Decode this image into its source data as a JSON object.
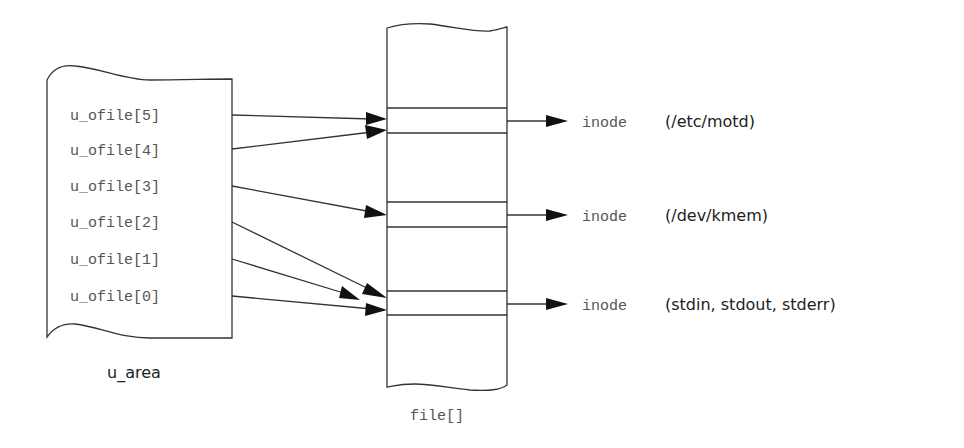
{
  "diagram": {
    "u_area": {
      "label": "u_area",
      "entries": [
        "u_ofile[5]",
        "u_ofile[4]",
        "u_ofile[3]",
        "u_ofile[2]",
        "u_ofile[1]",
        "u_ofile[0]"
      ]
    },
    "file_table": {
      "label": "file[]",
      "slots": 3
    },
    "inodes": [
      {
        "prefix": "inode",
        "target": "(/etc/motd)"
      },
      {
        "prefix": "inode",
        "target": "(/dev/kmem)"
      },
      {
        "prefix": "inode",
        "target": "(stdin, stdout, stderr)"
      }
    ],
    "edges": [
      {
        "from": "u_ofile[5]",
        "to": "file slot 1"
      },
      {
        "from": "u_ofile[4]",
        "to": "file slot 1"
      },
      {
        "from": "u_ofile[3]",
        "to": "file slot 2"
      },
      {
        "from": "u_ofile[2]",
        "to": "file slot 3"
      },
      {
        "from": "u_ofile[1]",
        "to": "file slot 3"
      },
      {
        "from": "u_ofile[0]",
        "to": "file slot 3"
      },
      {
        "from": "file slot 1",
        "to": "inode (/etc/motd)"
      },
      {
        "from": "file slot 2",
        "to": "inode (/dev/kmem)"
      },
      {
        "from": "file slot 3",
        "to": "inode (stdin, stdout, stderr)"
      }
    ]
  }
}
